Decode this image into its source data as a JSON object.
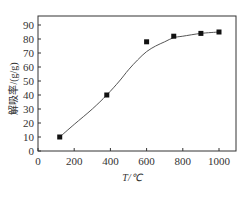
{
  "chart_data": {
    "type": "scatter",
    "title": "",
    "xlabel": "T/℃",
    "ylabel": "解吸率/(g/g)",
    "xlim": [
      0,
      1100
    ],
    "ylim": [
      0,
      95
    ],
    "x_ticks": [
      0,
      200,
      400,
      600,
      800,
      1000
    ],
    "y_ticks": [
      0,
      10,
      20,
      30,
      40,
      50,
      60,
      70,
      80,
      90
    ],
    "grid": false,
    "legend": null,
    "series": [
      {
        "name": "measured",
        "marker": "square",
        "x": [
          120,
          380,
          600,
          750,
          900,
          1000
        ],
        "y": [
          10,
          40,
          78,
          82,
          84,
          85
        ]
      }
    ],
    "fit_curve": {
      "type": "sigmoid",
      "x": [
        120,
        200,
        300,
        380,
        450,
        500,
        550,
        600,
        650,
        700,
        750,
        800,
        900,
        1000
      ],
      "y": [
        10,
        19,
        30,
        40,
        50,
        58,
        65,
        71,
        75,
        78,
        81,
        82,
        84,
        85
      ]
    },
    "colors": {
      "axis": "#333333",
      "marker": "#111111",
      "curve": "#555555"
    }
  }
}
